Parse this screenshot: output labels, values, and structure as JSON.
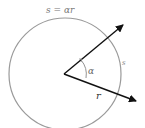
{
  "diagram": {
    "title_formula": "s = αr",
    "labels": {
      "angle": "α",
      "radius": "r",
      "arc": "s"
    },
    "colors": {
      "circle": "#9a9a9a",
      "arrows": "#111111",
      "angle_arc": "#888888",
      "formula_text": "#777777",
      "label_text": "#555555"
    },
    "geometry": {
      "center": [
        64,
        74
      ],
      "radius": 60,
      "arrow_upper_end": [
        124,
        24
      ],
      "arrow_lower_end": [
        137,
        101
      ]
    }
  }
}
